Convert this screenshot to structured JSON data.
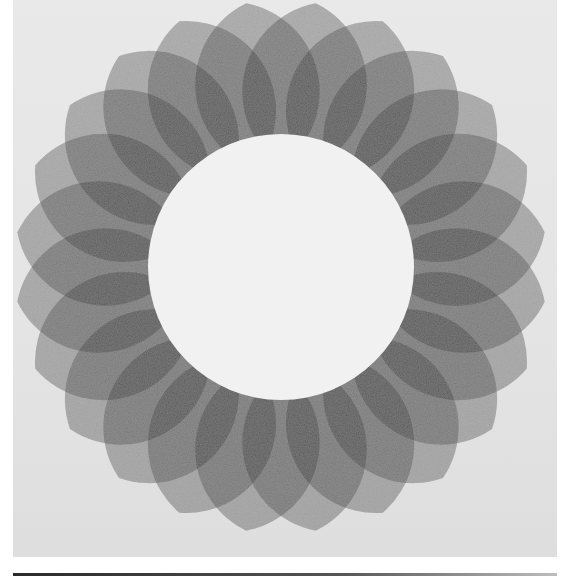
{
  "image": {
    "subject": "Radial rosette of overlapping translucent petals around a white central disc",
    "background_color": "#e6e6e6",
    "frame_color": "#ffffff",
    "bottom_strip_color": "#3a3a3a"
  },
  "rosette": {
    "center": [
      268,
      267
    ],
    "inner_circle_radius": 133,
    "inner_circle_color": "#f1f1f1",
    "petal_count": 24,
    "petal_inner_radius": 95,
    "petal_outer_radius": 266,
    "petal_half_width": 62,
    "petal_color": "#1e1e1e",
    "petal_opacity": 0.33,
    "rotation_offset_deg": 7.5
  }
}
